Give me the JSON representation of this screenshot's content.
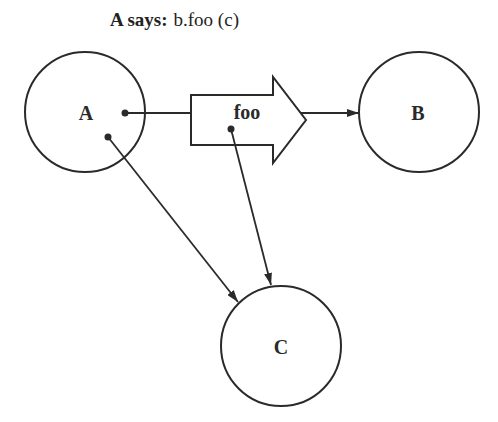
{
  "caption": {
    "speaker": "A says:",
    "message": "b.foo (c)"
  },
  "nodes": [
    {
      "id": "A",
      "label": "A",
      "cx": 85,
      "cy": 112,
      "r": 60
    },
    {
      "id": "B",
      "label": "B",
      "cx": 419,
      "cy": 112,
      "r": 60
    },
    {
      "id": "C",
      "label": "C",
      "cx": 281,
      "cy": 346,
      "r": 60
    }
  ],
  "message_arrow": {
    "label": "foo"
  },
  "edges": [
    {
      "from": "A",
      "to": "foo",
      "kind": "line"
    },
    {
      "from": "foo",
      "to": "B",
      "kind": "arrow"
    },
    {
      "from": "A",
      "to": "C",
      "kind": "arrow"
    },
    {
      "from": "foo",
      "to": "C",
      "kind": "arrow"
    }
  ],
  "colors": {
    "stroke": "#2a2a2a",
    "background": "#ffffff"
  }
}
